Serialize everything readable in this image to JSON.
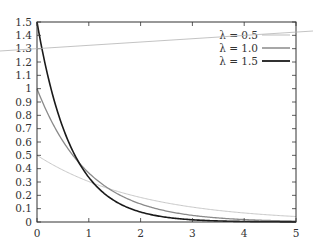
{
  "chart_data": {
    "type": "line",
    "title": "",
    "xlabel": "",
    "ylabel": "",
    "xlim": [
      0,
      5
    ],
    "ylim": [
      0,
      1.5
    ],
    "grid": false,
    "legend_position": "top-right",
    "x_ticks": [
      "0",
      "1",
      "2",
      "3",
      "4",
      "5"
    ],
    "y_ticks": [
      "0",
      "0.1",
      "0.2",
      "0.3",
      "0.4",
      "0.5",
      "0.6",
      "0.7",
      "0.8",
      "0.9",
      "1",
      "1.1",
      "1.2",
      "1.3",
      "1.4",
      "1.5"
    ],
    "x": [
      0,
      0.25,
      0.5,
      0.75,
      1,
      1.5,
      2,
      2.5,
      3,
      3.5,
      4,
      4.5,
      5
    ],
    "series": [
      {
        "name": "λ = 0.5",
        "lambda": 0.5,
        "color": "#c8c8c8",
        "width": 1.0,
        "values": [
          0.5,
          0.441,
          0.389,
          0.344,
          0.303,
          0.236,
          0.184,
          0.143,
          0.112,
          0.087,
          0.068,
          0.053,
          0.041
        ]
      },
      {
        "name": "λ = 1.0",
        "lambda": 1.0,
        "color": "#8a8a8a",
        "width": 1.3,
        "values": [
          1.0,
          0.779,
          0.607,
          0.472,
          0.368,
          0.223,
          0.135,
          0.082,
          0.05,
          0.03,
          0.018,
          0.011,
          0.007
        ]
      },
      {
        "name": "λ = 1.5",
        "lambda": 1.5,
        "color": "#1a1a1a",
        "width": 1.6,
        "values": [
          1.5,
          1.031,
          0.709,
          0.487,
          0.335,
          0.158,
          0.075,
          0.035,
          0.017,
          0.008,
          0.004,
          0.002,
          0.001
        ]
      }
    ]
  },
  "legend": {
    "items": [
      {
        "label": "λ = 0.5",
        "color": "#c8c8c8"
      },
      {
        "label": "λ = 1.0",
        "color": "#8a8a8a"
      },
      {
        "label": "λ = 1.5",
        "color": "#1a1a1a"
      }
    ]
  },
  "artifact_line": {
    "x1": 0,
    "y1": 51,
    "x2": 313,
    "y2": 31,
    "color": "#b4b4b4"
  }
}
